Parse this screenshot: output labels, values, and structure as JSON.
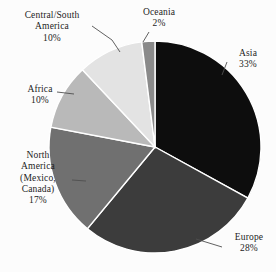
{
  "chart_data": {
    "type": "pie",
    "title": "",
    "subtitle": "",
    "xlabel": "",
    "ylabel": "",
    "legend_position": "none",
    "grid": false,
    "labels_inside": false,
    "start_angle_deg": 0,
    "direction": "clockwise",
    "categories": [
      "Asia",
      "Europe",
      "North America (Mexico, Canada)",
      "Africa",
      "Central/South America",
      "Oceania"
    ],
    "values": [
      33,
      28,
      17,
      10,
      10,
      2
    ],
    "unit": "%",
    "slices": [
      {
        "name": "Asia",
        "value": 33,
        "value_text": "33%",
        "color": "#0d0d0d",
        "label_lines": [
          "Asia",
          "33%"
        ],
        "leader_line": true
      },
      {
        "name": "Europe",
        "value": 28,
        "value_text": "28%",
        "color": "#3c3c3c",
        "label_lines": [
          "Europe",
          "28%"
        ],
        "leader_line": true
      },
      {
        "name": "North America (Mexico, Canada)",
        "value": 17,
        "value_text": "17%",
        "color": "#707070",
        "label_lines": [
          "North",
          "America",
          "(Mexico,",
          "Canada)",
          "17%"
        ],
        "leader_line": true
      },
      {
        "name": "Africa",
        "value": 10,
        "value_text": "10%",
        "color": "#b9b9b9",
        "label_lines": [
          "Africa",
          "10%"
        ],
        "leader_line": true
      },
      {
        "name": "Central/South America",
        "value": 10,
        "value_text": "10%",
        "color": "#e3e3e3",
        "label_lines": [
          "Central/South",
          "America",
          "10%"
        ],
        "leader_line": true
      },
      {
        "name": "Oceania",
        "value": 2,
        "value_text": "2%",
        "color": "#8a8a8a",
        "label_lines": [
          "Oceania",
          "2%"
        ],
        "leader_line": true
      }
    ]
  },
  "labels": {
    "central_south_america": {
      "line1": "Central/South",
      "line2": "America",
      "pct": "10%"
    },
    "oceania": {
      "name": "Oceania",
      "pct": "2%"
    },
    "asia": {
      "name": "Asia",
      "pct": "33%"
    },
    "africa": {
      "name": "Africa",
      "pct": "10%"
    },
    "north_america": {
      "line1": "North",
      "line2": "America",
      "line3": "(Mexico,",
      "line4": "Canada)",
      "pct": "17%"
    },
    "europe": {
      "name": "Europe",
      "pct": "28%"
    }
  },
  "colors": {
    "background": "#fcfcfc",
    "text": "#1c1c1c",
    "leader_line": "#555555",
    "slice_divider": "#ffffff"
  }
}
